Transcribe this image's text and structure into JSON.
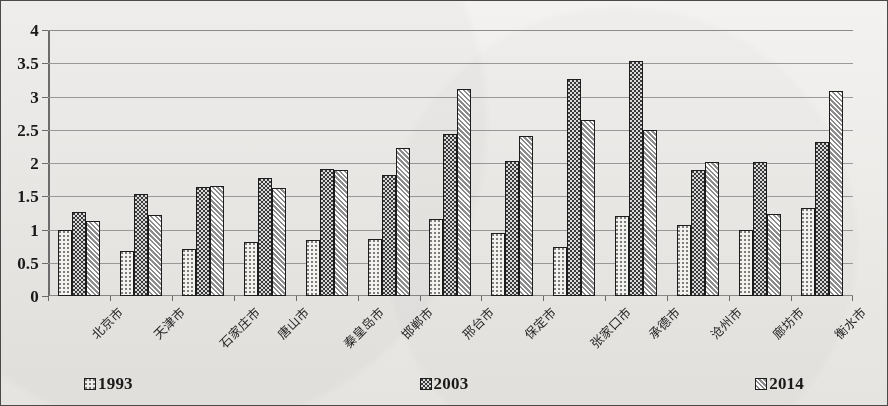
{
  "chart_data": {
    "type": "bar",
    "title": "",
    "xlabel": "",
    "ylabel": "",
    "ylim": [
      0,
      4
    ],
    "ytick_step": 0.5,
    "yticks": [
      "4",
      "3.5",
      "3",
      "2.5",
      "2",
      "1.5",
      "1",
      "0.5",
      "0"
    ],
    "grid": true,
    "legend_position": "bottom",
    "categories": [
      "北京市",
      "天津市",
      "石家庄市",
      "唐山市",
      "秦皇岛市",
      "邯郸市",
      "邢台市",
      "保定市",
      "张家口市",
      "承德市",
      "沧州市",
      "廊坊市",
      "衡水市"
    ],
    "series": [
      {
        "name": "1993",
        "pattern": "light-dotted",
        "values": [
          1.0,
          0.68,
          0.71,
          0.81,
          0.84,
          0.86,
          1.16,
          0.95,
          0.74,
          1.2,
          1.07,
          1.0,
          1.33
        ]
      },
      {
        "name": "2003",
        "pattern": "dark-checkered",
        "values": [
          1.26,
          1.53,
          1.64,
          1.78,
          1.91,
          1.82,
          2.43,
          2.03,
          3.27,
          3.53,
          1.89,
          2.01,
          2.32
        ]
      },
      {
        "name": "2014",
        "pattern": "diagonal-hatch",
        "values": [
          1.13,
          1.22,
          1.65,
          1.62,
          1.9,
          2.23,
          3.12,
          2.4,
          2.65,
          2.5,
          2.02,
          1.24,
          3.08
        ]
      }
    ]
  },
  "legend": {
    "items": [
      {
        "label": "1993",
        "pattern": "light-dotted"
      },
      {
        "label": "2003",
        "pattern": "dark-checkered"
      },
      {
        "label": "2014",
        "pattern": "diagonal-hatch"
      }
    ]
  },
  "colors": {
    "background": "#edebe8",
    "border": "#4a4a4a",
    "gridline": "#9b9b9b",
    "axis": "#6d6d6d",
    "series_1993": "#f2f1ee",
    "series_2003": "#3a3a3a",
    "series_2014": "#d5d4d1",
    "bar_outline": "#1d1d1d",
    "text": "#1a1a1a"
  }
}
